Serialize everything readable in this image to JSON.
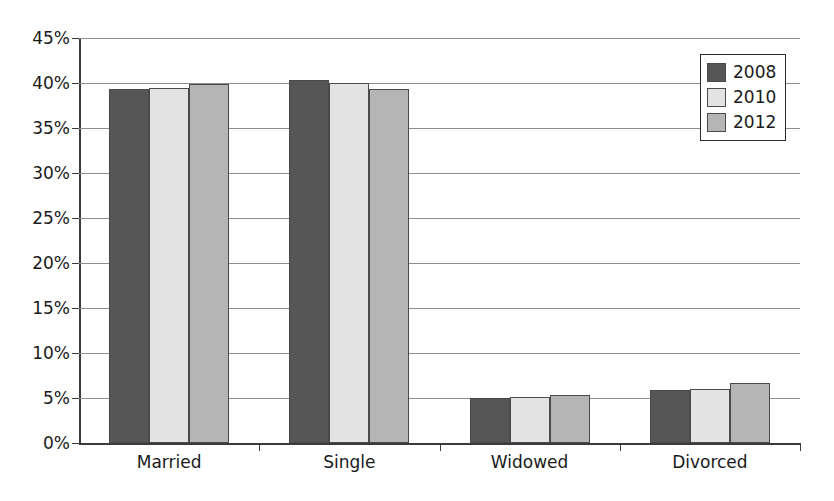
{
  "chart_data": {
    "type": "bar",
    "title": "",
    "subtitle": "",
    "xlabel": "",
    "ylabel": "",
    "categories": [
      "Married",
      "Single",
      "Widowed",
      "Divorced"
    ],
    "series": [
      {
        "name": "2008",
        "color": "#565656",
        "values": [
          39.3,
          40.3,
          5.0,
          5.9
        ]
      },
      {
        "name": "2010",
        "color": "#e3e3e3",
        "values": [
          39.4,
          40.0,
          5.1,
          6.0
        ]
      },
      {
        "name": "2012",
        "color": "#b5b5b5",
        "values": [
          39.9,
          39.3,
          5.3,
          6.7
        ]
      }
    ],
    "ylim": [
      0,
      45
    ],
    "ytick_step": 5,
    "ytick_labels": [
      "0%",
      "5%",
      "10%",
      "15%",
      "20%",
      "25%",
      "30%",
      "35%",
      "40%",
      "45%"
    ],
    "ytick_values": [
      0,
      5,
      10,
      15,
      20,
      25,
      30,
      35,
      40,
      45
    ],
    "grid": true,
    "grid_axis": "y",
    "legend_position": "top-right",
    "legend_entries": [
      "2008",
      "2010",
      "2012"
    ],
    "value_unit": "%"
  },
  "colors": {
    "axis": "#3a3a3a",
    "gridline": "#8e8e8e",
    "text": "#1a1a1a",
    "background": "#ffffff",
    "bar_border": "#4a4a4a"
  }
}
